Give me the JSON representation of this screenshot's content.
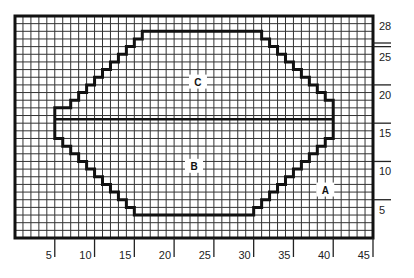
{
  "diagram": {
    "type": "knitting-chart-grid",
    "grid": {
      "columns": 45,
      "rows": 28
    },
    "x_axis": {
      "ticks": [
        5,
        10,
        15,
        20,
        25,
        30,
        35,
        40,
        45
      ]
    },
    "y_axis": {
      "ticks": [
        5,
        10,
        15,
        20,
        25,
        28
      ]
    },
    "regions": [
      {
        "id": "A",
        "label": "A"
      },
      {
        "id": "B",
        "label": "B"
      },
      {
        "id": "C",
        "label": "C"
      }
    ],
    "colors": {
      "line": "#111111",
      "grid": "#333333",
      "background": "#ffffff"
    }
  }
}
